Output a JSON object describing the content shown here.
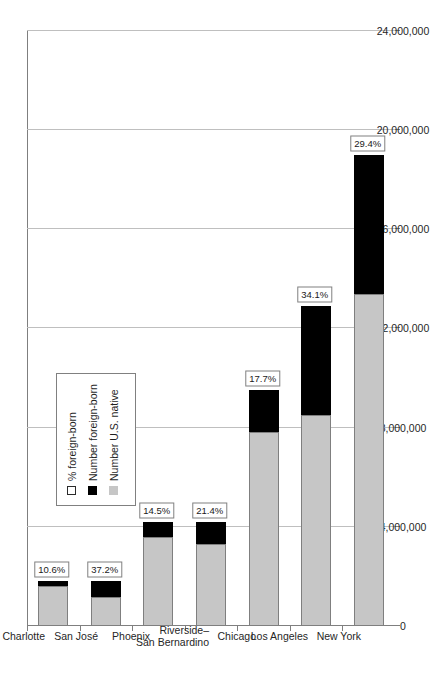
{
  "chart_data": {
    "type": "bar",
    "orientation": "horizontal-rotated",
    "stacked": true,
    "title": "",
    "xlabel": "",
    "ylabel": "",
    "categories": [
      "Charlotte",
      "San José",
      "Phoenix",
      "Riverside–\nSan Bernardino",
      "Chicago",
      "Los Angeles",
      "New York"
    ],
    "series": [
      {
        "name": "Number foreign-born",
        "color": "#000000",
        "values": [
          190000,
          680000,
          610000,
          900000,
          1680000,
          4400000,
          5590000
        ]
      },
      {
        "name": "Number U.S. native",
        "color": "#c6c6c6",
        "values": [
          1610000,
          1150000,
          3590000,
          3300000,
          7820000,
          8500000,
          13410000
        ]
      }
    ],
    "totals": [
      1800000,
      1830000,
      4200000,
      4200000,
      9500000,
      12900000,
      19000000
    ],
    "point_labels": {
      "name": "% foreign-born",
      "values": [
        "10.6%",
        "37.2%",
        "14.5%",
        "21.4%",
        "17.7%",
        "34.1%",
        "29.4%"
      ]
    },
    "value_axis": {
      "ticks": [
        0,
        4000000,
        8000000,
        12000000,
        16000000,
        20000000,
        24000000
      ],
      "tick_labels": [
        "0",
        "4,000,000",
        "8,000,000",
        "12,000,000",
        "16,000,000",
        "20,000,000",
        "24,000,000"
      ],
      "min": 0,
      "max": 24000000,
      "grid": true
    },
    "legend": {
      "position": "inside-lower-left",
      "entries": [
        {
          "label": "% foreign-born",
          "swatch": "outline-white"
        },
        {
          "label": "Number foreign-born",
          "swatch": "black"
        },
        {
          "label": "Number U.S. native",
          "swatch": "gray"
        }
      ]
    },
    "colors": {
      "foreign_born": "#000000",
      "us_native": "#c6c6c6",
      "grid": "#bfbfbf",
      "axis": "#7f7f7f",
      "text": "#262626",
      "background": "#ffffff"
    }
  }
}
